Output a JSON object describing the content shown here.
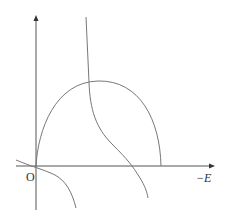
{
  "diagram": {
    "axes": {
      "origin_label": "O",
      "x_label": "−E",
      "y_label": ""
    },
    "curves": [
      {
        "name": "arc",
        "description": "semicircular arc from origin to point on -E axis"
      },
      {
        "name": "hyperbola-upper",
        "description": "decreasing curve from top crossing -E axis"
      },
      {
        "name": "hyperbola-lower",
        "description": "decreasing curve passing near origin going downward"
      }
    ],
    "colors": {
      "line": "#777777",
      "axis": "#555555",
      "background": "#ffffff"
    }
  }
}
